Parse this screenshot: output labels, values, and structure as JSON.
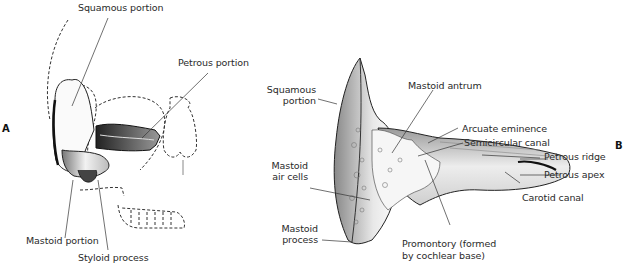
{
  "figure": {
    "panels": [
      {
        "id": "A",
        "label": "A",
        "labels": [
          {
            "key": "squamous",
            "text": "Squamous portion"
          },
          {
            "key": "petrous",
            "text": "Petrous portion"
          },
          {
            "key": "mastoid",
            "text": "Mastoid portion"
          },
          {
            "key": "styloid",
            "text": "Styloid process"
          }
        ]
      },
      {
        "id": "B",
        "label": "B",
        "labels": [
          {
            "key": "squamous_1",
            "text": "Squamous"
          },
          {
            "key": "squamous_2",
            "text": "portion"
          },
          {
            "key": "mastoid_antrum",
            "text": "Mastoid antrum"
          },
          {
            "key": "arcuate",
            "text": "Arcuate eminence"
          },
          {
            "key": "semicircular",
            "text": "Semicircular canal"
          },
          {
            "key": "petrous_ridge",
            "text": "Petrous ridge"
          },
          {
            "key": "petrous_apex",
            "text": "Petrous apex"
          },
          {
            "key": "carotid",
            "text": "Carotid canal"
          },
          {
            "key": "air_cells_1",
            "text": "Mastoid"
          },
          {
            "key": "air_cells_2",
            "text": "air cells"
          },
          {
            "key": "mastoid_process_1",
            "text": "Mastoid"
          },
          {
            "key": "mastoid_process_2",
            "text": "process"
          },
          {
            "key": "promontory_1",
            "text": "Promontory (formed"
          },
          {
            "key": "promontory_2",
            "text": "by cochlear base)"
          }
        ]
      }
    ],
    "colors": {
      "ink": "#2a2a2a",
      "shade": "#555555",
      "background": "#ffffff"
    }
  }
}
